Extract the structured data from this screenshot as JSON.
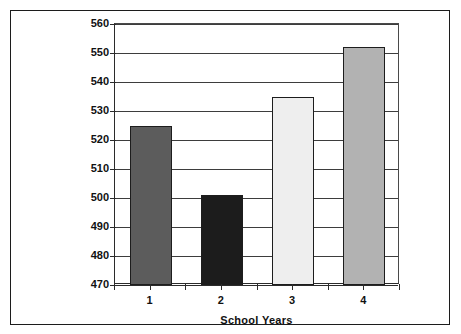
{
  "figure": {
    "caption_fragment": "",
    "border_color": "#1c1c1c",
    "background": "#ffffff"
  },
  "chart_data": {
    "type": "bar",
    "title": "",
    "subtitle": "",
    "xlabel": "School Years",
    "ylabel": "",
    "categories": [
      "1",
      "2",
      "3",
      "4"
    ],
    "values": [
      525,
      501,
      535,
      552
    ],
    "ylim": [
      470,
      560
    ],
    "ytick_step": 10,
    "yticks": [
      470,
      480,
      490,
      500,
      510,
      520,
      530,
      540,
      550,
      560
    ],
    "ytick_labels": [
      "470",
      "480",
      "490",
      "500",
      "510",
      "520",
      "530",
      "540",
      "550",
      "560"
    ],
    "grid": "horizontal",
    "legend": "none",
    "bar_colors": [
      "#5c5c5c",
      "#1c1c1c",
      "#eeeeee",
      "#b2b2b2"
    ],
    "bar_edge_color": "#1d1d1d",
    "bars": [
      {
        "category": "1",
        "value": 525,
        "color": "#5c5c5c"
      },
      {
        "category": "2",
        "value": 501,
        "color": "#1c1c1c"
      },
      {
        "category": "3",
        "value": 535,
        "color": "#eeeeee"
      },
      {
        "category": "4",
        "value": 552,
        "color": "#b2b2b2"
      }
    ]
  }
}
